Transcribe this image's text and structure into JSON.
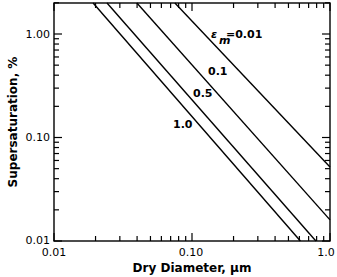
{
  "chart_data": {
    "type": "line",
    "title": "",
    "xlabel": "Dry Diameter, μm",
    "ylabel": "Supersaturation, %",
    "xscale": "log",
    "yscale": "log",
    "xlim": [
      0.01,
      1.0
    ],
    "ylim": [
      0.01,
      2.0
    ],
    "grid": false,
    "x_tick_labels": [
      "0.01",
      "0.10",
      "1.0"
    ],
    "y_tick_labels": [
      "0.01",
      "0.10",
      "1.00"
    ],
    "series": [
      {
        "name": "εm=0.01",
        "label": "εm=0.01",
        "x": [
          0.0752,
          1.0
        ],
        "y": [
          2.0,
          0.052
        ]
      },
      {
        "name": "0.1",
        "label": "0.1",
        "x": [
          0.0399,
          1.0
        ],
        "y": [
          2.0,
          0.016
        ]
      },
      {
        "name": "0.5",
        "label": "0.5",
        "x": [
          0.0242,
          0.79
        ],
        "y": [
          2.0,
          0.01
        ]
      },
      {
        "name": "1.0",
        "label": "1.0",
        "x": [
          0.0192,
          0.61
        ],
        "y": [
          2.0,
          0.01
        ]
      }
    ],
    "annotations": [
      {
        "text": "εm=0.01",
        "x": 0.13,
        "y": 1.3
      },
      {
        "text": "0.1",
        "x": 0.145,
        "y": 0.6
      },
      {
        "text": "0.5",
        "x": 0.13,
        "y": 0.37
      },
      {
        "text": "1.0",
        "x": 0.1,
        "y": 0.18
      }
    ]
  },
  "labels": {
    "x_axis_title": "Dry Diameter, μm",
    "y_axis_title": "Supersaturation, %",
    "x_ticks": [
      "0.01",
      "0.10",
      "1.0"
    ],
    "y_ticks": [
      "1.00",
      "0.10",
      "0.01"
    ],
    "curve_labels": {
      "eps": "ε",
      "sub": "m",
      "first": "=0.01",
      "c2": "0.1",
      "c3": "0.5",
      "c4": "1.0"
    }
  }
}
